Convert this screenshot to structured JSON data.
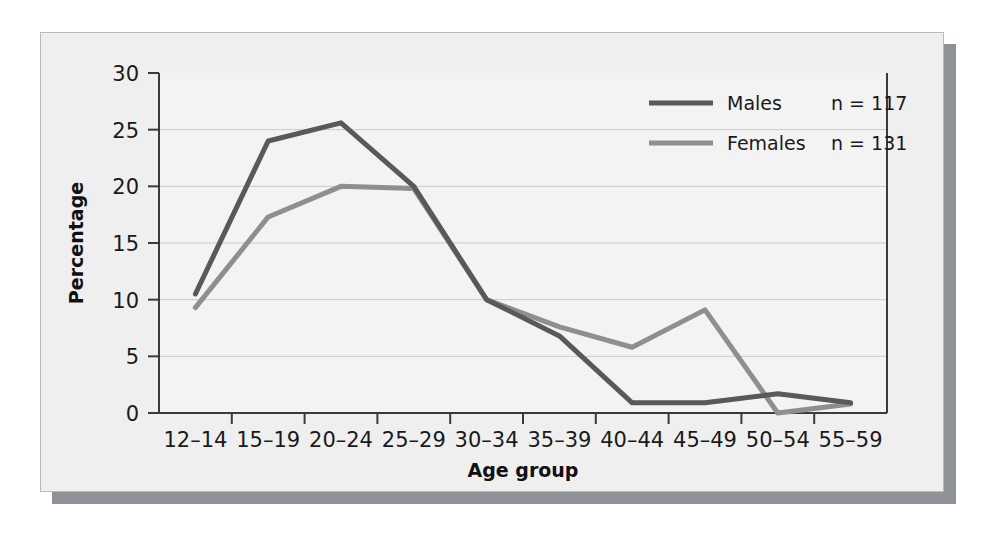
{
  "chart_data": {
    "type": "line",
    "title": "",
    "xlabel": "Age group",
    "ylabel": "Percentage",
    "categories": [
      "12–14",
      "15–19",
      "20–24",
      "25–29",
      "30–34",
      "35–39",
      "40–44",
      "45–49",
      "50–54",
      "55–59"
    ],
    "ylim": [
      0,
      30
    ],
    "yticks": [
      0,
      5,
      10,
      15,
      20,
      25,
      30
    ],
    "ytick_labels": [
      "0",
      "5",
      "10",
      "15",
      "20",
      "25",
      "30"
    ],
    "grid": "horizontal",
    "legend_position": "top-right",
    "series": [
      {
        "name": "Males",
        "n_label": "n = 117",
        "n": 117,
        "color": "#595959",
        "values": [
          10.5,
          24.0,
          25.6,
          20.0,
          10.0,
          6.8,
          0.9,
          0.9,
          1.7,
          0.9
        ]
      },
      {
        "name": "Females",
        "n_label": "n = 131",
        "n": 131,
        "color": "#8f8f8f",
        "values": [
          9.3,
          17.3,
          20.0,
          19.8,
          10.0,
          7.6,
          5.8,
          9.1,
          0.0,
          0.8
        ]
      }
    ]
  },
  "axes": {
    "y_title": "Percentage",
    "x_title": "Age group",
    "y_tick_labels": [
      "30",
      "25",
      "20",
      "15",
      "10",
      "5",
      "0"
    ],
    "x_tick_labels": [
      "12–14",
      "15–19",
      "20–24",
      "25–29",
      "30–34",
      "35–39",
      "40–44",
      "45–49",
      "50–54",
      "55–59"
    ]
  },
  "legend": {
    "entries": [
      {
        "label": "Males",
        "count_text": "n = 117",
        "swatch_color": "#595959"
      },
      {
        "label": "Females",
        "count_text": "n = 131",
        "swatch_color": "#8f8f8f"
      }
    ]
  },
  "colors": {
    "page_background": "#ffffff",
    "panel_background": "#efefef",
    "panel_border": "#b9b9b9",
    "panel_shadow": "#8e9195",
    "plot_background": "#f3f3f3",
    "axis_line": "#3a3a3a",
    "gridline": "#c9c9c9",
    "males_line": "#595959",
    "females_line": "#8f8f8f",
    "text": "#1a1a1a"
  }
}
